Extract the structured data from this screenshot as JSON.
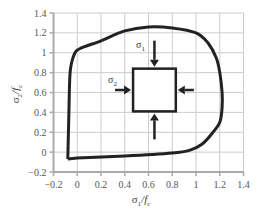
{
  "chart_data": {
    "type": "line",
    "title": "",
    "xlabel": "σ1/fc",
    "ylabel": "σ2/fc",
    "xlim": [
      -0.2,
      1.4
    ],
    "ylim": [
      -0.2,
      1.4
    ],
    "grid": true,
    "legend": null,
    "x_ticks": [
      "-0.2",
      "0",
      "0.2",
      "0.4",
      "0.6",
      "0.8",
      "1",
      "1.2",
      "1.4"
    ],
    "y_ticks": [
      "-0.2",
      "0",
      "0.2",
      "0.4",
      "0.6",
      "0.8",
      "1",
      "1.2",
      "1.4"
    ],
    "series": [
      {
        "name": "biaxial failure envelope",
        "color": "#222222",
        "points": [
          [
            -0.08,
            -0.07
          ],
          [
            -0.07,
            0.4
          ],
          [
            -0.06,
            0.8
          ],
          [
            -0.03,
            0.97
          ],
          [
            0.02,
            1.04
          ],
          [
            0.2,
            1.12
          ],
          [
            0.4,
            1.22
          ],
          [
            0.6,
            1.26
          ],
          [
            0.8,
            1.25
          ],
          [
            1.0,
            1.2
          ],
          [
            1.1,
            1.1
          ],
          [
            1.17,
            0.95
          ],
          [
            1.2,
            0.8
          ],
          [
            1.22,
            0.6
          ],
          [
            1.22,
            0.45
          ],
          [
            1.2,
            0.3
          ],
          [
            1.13,
            0.18
          ],
          [
            1.05,
            0.08
          ],
          [
            0.95,
            0.02
          ],
          [
            0.8,
            -0.01
          ],
          [
            0.4,
            -0.04
          ],
          [
            0.0,
            -0.06
          ],
          [
            -0.08,
            -0.07
          ]
        ]
      }
    ],
    "annotations": [
      {
        "type": "element-square",
        "x_range": [
          0.47,
          0.83
        ],
        "y_range": [
          0.41,
          0.84
        ]
      },
      {
        "type": "label",
        "text": "σ1",
        "position": "above square, left of vertical arrow"
      },
      {
        "type": "label",
        "text": "σ2",
        "position": "left of square, above horizontal arrow"
      },
      {
        "type": "arrows",
        "description": "four inward compressive arrows on each side of square"
      }
    ]
  },
  "labels": {
    "xlabel_main": "σ",
    "xlabel_sub": "1",
    "xlabel_tail": "/f",
    "xlabel_tail_sub": "c",
    "ylabel_main": "σ",
    "ylabel_sub": "2",
    "ylabel_tail": "/f",
    "ylabel_tail_sub": "c",
    "sigma1": "σ",
    "sigma1_sub": "1",
    "sigma2": "σ",
    "sigma2_sub": "2"
  },
  "colors": {
    "curve": "#222222",
    "grid": "#cccccc",
    "axis": "#aaaaaa",
    "text": "#555555"
  }
}
